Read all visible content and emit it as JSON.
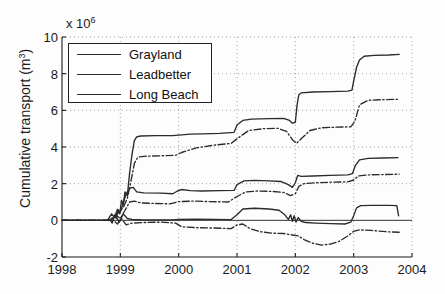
{
  "chart_data": {
    "type": "line",
    "title": "",
    "xlabel": "",
    "ylabel": "Cumulative transport (m",
    "ylabel_sup": "3",
    "ylabel_close": ")",
    "y_exponent_prefix": "x 10",
    "y_exponent": "6",
    "xlim": [
      1998,
      2004
    ],
    "ylim": [
      -2,
      10
    ],
    "xticks": [
      "1998",
      "1999",
      "2000",
      "2001",
      "2002",
      "2003",
      "2004"
    ],
    "yticks": [
      "10",
      "8",
      "6",
      "4",
      "2",
      "0",
      "-2"
    ],
    "ytick_values": [
      10,
      8,
      6,
      4,
      2,
      0,
      -2
    ],
    "grid": true,
    "grid_style": "dotted",
    "legend_position": "top-left",
    "legend": [
      "Grayland",
      "Leadbetter",
      "Long Beach"
    ],
    "series": [
      {
        "name": "Grayland-upper",
        "label": "Grayland",
        "style": "solid",
        "color": "#2b2b2b",
        "points": [
          [
            1998.0,
            0.0
          ],
          [
            1998.75,
            0.0
          ],
          [
            1998.82,
            0.05
          ],
          [
            1998.86,
            -0.15
          ],
          [
            1998.9,
            0.3
          ],
          [
            1998.93,
            0.1
          ],
          [
            1998.96,
            0.55
          ],
          [
            1998.99,
            0.35
          ],
          [
            1999.02,
            1.1
          ],
          [
            1999.05,
            0.85
          ],
          [
            1999.08,
            1.55
          ],
          [
            1999.12,
            1.35
          ],
          [
            1999.16,
            2.6
          ],
          [
            1999.2,
            3.6
          ],
          [
            1999.24,
            4.35
          ],
          [
            1999.28,
            4.55
          ],
          [
            1999.35,
            4.6
          ],
          [
            1999.6,
            4.62
          ],
          [
            1999.9,
            4.62
          ],
          [
            2000.0,
            4.65
          ],
          [
            2000.2,
            4.7
          ],
          [
            2000.4,
            4.72
          ],
          [
            2000.7,
            4.74
          ],
          [
            2000.95,
            4.8
          ],
          [
            2001.0,
            5.2
          ],
          [
            2001.1,
            5.45
          ],
          [
            2001.25,
            5.52
          ],
          [
            2001.55,
            5.55
          ],
          [
            2001.8,
            5.56
          ],
          [
            2001.9,
            5.45
          ],
          [
            2001.95,
            5.3
          ],
          [
            2002.0,
            5.35
          ],
          [
            2002.03,
            6.3
          ],
          [
            2002.06,
            6.85
          ],
          [
            2002.1,
            6.95
          ],
          [
            2002.3,
            7.0
          ],
          [
            2002.6,
            7.02
          ],
          [
            2002.9,
            7.05
          ],
          [
            2002.97,
            7.1
          ],
          [
            2003.0,
            7.6
          ],
          [
            2003.05,
            8.35
          ],
          [
            2003.1,
            8.75
          ],
          [
            2003.18,
            8.95
          ],
          [
            2003.35,
            9.0
          ],
          [
            2003.6,
            9.02
          ],
          [
            2003.78,
            9.05
          ]
        ]
      },
      {
        "name": "Leadbetter-upper",
        "label": "Leadbetter",
        "style": "dashdot",
        "color": "#2b2b2b",
        "points": [
          [
            1998.0,
            0.0
          ],
          [
            1998.8,
            0.0
          ],
          [
            1998.9,
            0.2
          ],
          [
            1998.98,
            0.45
          ],
          [
            1999.05,
            0.7
          ],
          [
            1999.12,
            1.2
          ],
          [
            1999.18,
            2.1
          ],
          [
            1999.24,
            3.1
          ],
          [
            1999.3,
            3.45
          ],
          [
            1999.45,
            3.5
          ],
          [
            1999.7,
            3.52
          ],
          [
            1999.95,
            3.55
          ],
          [
            2000.05,
            3.7
          ],
          [
            2000.3,
            3.95
          ],
          [
            2000.6,
            4.1
          ],
          [
            2000.9,
            4.2
          ],
          [
            2001.0,
            4.45
          ],
          [
            2001.2,
            4.9
          ],
          [
            2001.45,
            5.0
          ],
          [
            2001.7,
            5.02
          ],
          [
            2001.85,
            4.85
          ],
          [
            2001.95,
            4.4
          ],
          [
            2002.02,
            4.2
          ],
          [
            2002.1,
            4.45
          ],
          [
            2002.25,
            4.9
          ],
          [
            2002.45,
            5.05
          ],
          [
            2002.7,
            5.08
          ],
          [
            2002.95,
            5.1
          ],
          [
            2003.02,
            5.4
          ],
          [
            2003.1,
            6.3
          ],
          [
            2003.25,
            6.55
          ],
          [
            2003.5,
            6.58
          ],
          [
            2003.75,
            6.6
          ]
        ]
      },
      {
        "name": "Grayland-mid",
        "label": "Grayland",
        "style": "solid",
        "color": "#2b2b2b",
        "points": [
          [
            1998.0,
            0.0
          ],
          [
            1998.78,
            0.0
          ],
          [
            1998.85,
            0.35
          ],
          [
            1998.9,
            0.15
          ],
          [
            1998.95,
            0.6
          ],
          [
            1999.0,
            0.45
          ],
          [
            1999.05,
            0.95
          ],
          [
            1999.1,
            1.45
          ],
          [
            1999.16,
            1.75
          ],
          [
            1999.22,
            1.8
          ],
          [
            1999.28,
            1.55
          ],
          [
            1999.4,
            1.5
          ],
          [
            1999.7,
            1.48
          ],
          [
            1999.9,
            1.45
          ],
          [
            1999.98,
            1.6
          ],
          [
            2000.05,
            1.68
          ],
          [
            2000.2,
            1.62
          ],
          [
            2000.4,
            1.6
          ],
          [
            2000.7,
            1.62
          ],
          [
            2000.95,
            1.63
          ],
          [
            2001.0,
            1.95
          ],
          [
            2001.12,
            2.15
          ],
          [
            2001.3,
            2.18
          ],
          [
            2001.55,
            2.15
          ],
          [
            2001.75,
            2.12
          ],
          [
            2001.88,
            1.95
          ],
          [
            2001.95,
            1.8
          ],
          [
            2002.0,
            2.05
          ],
          [
            2002.04,
            2.45
          ],
          [
            2002.1,
            2.4
          ],
          [
            2002.3,
            2.42
          ],
          [
            2002.6,
            2.45
          ],
          [
            2002.9,
            2.48
          ],
          [
            2002.98,
            2.55
          ],
          [
            2003.03,
            3.0
          ],
          [
            2003.1,
            3.3
          ],
          [
            2003.25,
            3.38
          ],
          [
            2003.5,
            3.4
          ],
          [
            2003.76,
            3.42
          ]
        ]
      },
      {
        "name": "Leadbetter-mid",
        "label": "Leadbetter",
        "style": "dashdot",
        "color": "#2b2b2b",
        "points": [
          [
            1998.0,
            0.0
          ],
          [
            1998.82,
            0.0
          ],
          [
            1998.92,
            0.3
          ],
          [
            1999.0,
            0.1
          ],
          [
            1999.08,
            0.55
          ],
          [
            1999.16,
            1.0
          ],
          [
            1999.24,
            1.05
          ],
          [
            1999.35,
            0.95
          ],
          [
            1999.6,
            0.92
          ],
          [
            1999.85,
            0.9
          ],
          [
            2000.0,
            1.02
          ],
          [
            2000.25,
            1.05
          ],
          [
            2000.55,
            1.02
          ],
          [
            2000.85,
            1.0
          ],
          [
            2001.0,
            1.3
          ],
          [
            2001.15,
            1.55
          ],
          [
            2001.35,
            1.6
          ],
          [
            2001.6,
            1.58
          ],
          [
            2001.8,
            1.52
          ],
          [
            2001.92,
            1.35
          ],
          [
            2002.0,
            1.45
          ],
          [
            2002.06,
            1.85
          ],
          [
            2002.15,
            2.0
          ],
          [
            2002.35,
            2.05
          ],
          [
            2002.6,
            2.08
          ],
          [
            2002.9,
            2.1
          ],
          [
            2003.0,
            2.2
          ],
          [
            2003.08,
            2.42
          ],
          [
            2003.25,
            2.48
          ],
          [
            2003.55,
            2.5
          ],
          [
            2003.78,
            2.52
          ]
        ]
      },
      {
        "name": "LongBeach-low",
        "label": "Long Beach",
        "style": "solid",
        "color": "#2b2b2b",
        "points": [
          [
            1998.0,
            0.0
          ],
          [
            1998.85,
            0.0
          ],
          [
            1998.92,
            0.25
          ],
          [
            1998.98,
            -0.1
          ],
          [
            1999.05,
            0.35
          ],
          [
            1999.12,
            0.1
          ],
          [
            1999.2,
            0.05
          ],
          [
            1999.35,
            0.03
          ],
          [
            1999.6,
            0.02
          ],
          [
            1999.9,
            0.02
          ],
          [
            2000.0,
            0.05
          ],
          [
            2000.3,
            0.06
          ],
          [
            2000.6,
            0.05
          ],
          [
            2000.9,
            0.04
          ],
          [
            2001.0,
            0.3
          ],
          [
            2001.1,
            0.62
          ],
          [
            2001.3,
            0.66
          ],
          [
            2001.55,
            0.62
          ],
          [
            2001.72,
            0.55
          ],
          [
            2001.82,
            0.3
          ],
          [
            2001.88,
            0.05
          ],
          [
            2001.92,
            0.3
          ],
          [
            2001.95,
            -0.05
          ],
          [
            2001.98,
            0.25
          ],
          [
            2002.01,
            -0.1
          ],
          [
            2002.05,
            0.15
          ],
          [
            2002.1,
            -0.05
          ],
          [
            2002.18,
            -0.12
          ],
          [
            2002.35,
            -0.15
          ],
          [
            2002.6,
            -0.18
          ],
          [
            2002.85,
            -0.2
          ],
          [
            2002.95,
            -0.1
          ],
          [
            2003.0,
            0.25
          ],
          [
            2003.05,
            0.68
          ],
          [
            2003.12,
            0.8
          ],
          [
            2003.3,
            0.82
          ],
          [
            2003.6,
            0.82
          ],
          [
            2003.74,
            0.8
          ],
          [
            2003.77,
            0.25
          ]
        ]
      },
      {
        "name": "LongBeach-negative",
        "label": "Long Beach",
        "style": "dashdot",
        "color": "#2b2b2b",
        "points": [
          [
            1998.0,
            0.0
          ],
          [
            1998.88,
            0.0
          ],
          [
            1998.95,
            -0.2
          ],
          [
            1999.02,
            0.1
          ],
          [
            1999.1,
            -0.25
          ],
          [
            1999.2,
            -0.15
          ],
          [
            1999.4,
            -0.12
          ],
          [
            1999.7,
            -0.1
          ],
          [
            1999.95,
            -0.15
          ],
          [
            2000.05,
            -0.35
          ],
          [
            2000.3,
            -0.4
          ],
          [
            2000.6,
            -0.42
          ],
          [
            2000.9,
            -0.45
          ],
          [
            2001.0,
            -0.25
          ],
          [
            2001.1,
            -0.2
          ],
          [
            2001.22,
            -0.45
          ],
          [
            2001.4,
            -0.62
          ],
          [
            2001.6,
            -0.7
          ],
          [
            2001.8,
            -0.72
          ],
          [
            2001.95,
            -0.8
          ],
          [
            2002.05,
            -0.85
          ],
          [
            2002.15,
            -1.05
          ],
          [
            2002.3,
            -1.25
          ],
          [
            2002.45,
            -1.35
          ],
          [
            2002.6,
            -1.3
          ],
          [
            2002.75,
            -1.15
          ],
          [
            2002.9,
            -0.85
          ],
          [
            2003.0,
            -0.6
          ],
          [
            2003.1,
            -0.52
          ],
          [
            2003.3,
            -0.55
          ],
          [
            2003.55,
            -0.62
          ],
          [
            2003.78,
            -0.65
          ]
        ]
      }
    ]
  },
  "axes": {
    "plot_left_px": 62,
    "plot_right_px": 412,
    "plot_top_px": 37,
    "plot_bottom_px": 257
  }
}
